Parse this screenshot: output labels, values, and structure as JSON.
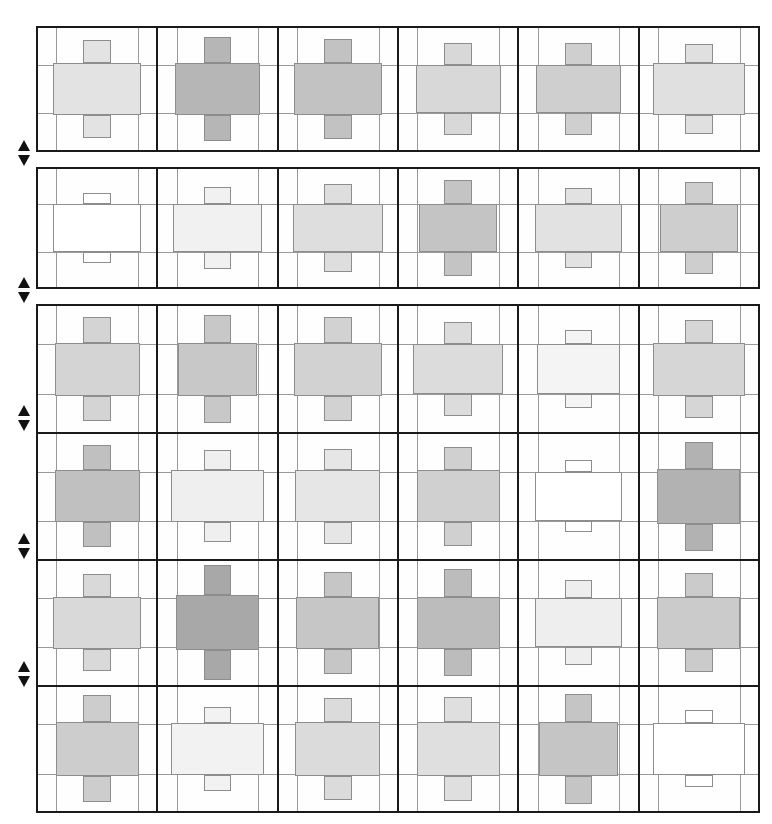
{
  "figure": {
    "type": "cell-grid-matrix",
    "columns": 6,
    "rows": 6,
    "cell_glyph": "cross-bar-plus",
    "colors": {
      "background": "#ffffff",
      "frame": "#1a1a1a",
      "guide_line": "#9a9a9a",
      "fill_outline": "#8d8d8d",
      "empty_fill": "#ffffff"
    },
    "geometry": {
      "grid_left": 36,
      "grid_right": 760,
      "cell_width": 120.7,
      "row_height": 123
    },
    "blocks": [
      {
        "id": "block-1",
        "top": 26,
        "height": 126,
        "row_indices": [
          0
        ]
      },
      {
        "id": "block-2",
        "top": 167,
        "height": 122,
        "row_indices": [
          1
        ]
      },
      {
        "id": "block-3",
        "top": 304,
        "height": 509,
        "row_indices": [
          2,
          3,
          4,
          5
        ]
      }
    ],
    "arrow_markers": [
      {
        "name": "marker-1-up",
        "dir": "up",
        "x": 18,
        "y": 140
      },
      {
        "name": "marker-1-down",
        "dir": "down",
        "x": 18,
        "y": 155
      },
      {
        "name": "marker-2-up",
        "dir": "up",
        "x": 18,
        "y": 277
      },
      {
        "name": "marker-2-down",
        "dir": "down",
        "x": 18,
        "y": 292
      },
      {
        "name": "marker-3-up",
        "dir": "up",
        "x": 18,
        "y": 405
      },
      {
        "name": "marker-3-down",
        "dir": "down",
        "x": 18,
        "y": 420
      },
      {
        "name": "marker-4-up",
        "dir": "up",
        "x": 18,
        "y": 533
      },
      {
        "name": "marker-4-down",
        "dir": "down",
        "x": 18,
        "y": 548
      },
      {
        "name": "marker-5-up",
        "dir": "up",
        "x": 18,
        "y": 661
      },
      {
        "name": "marker-5-down",
        "dir": "down",
        "x": 18,
        "y": 676
      }
    ]
  },
  "chart_data": {
    "type": "heatmap",
    "title": "",
    "xlabel": "",
    "ylabel": "",
    "categories_x": [
      "C1",
      "C2",
      "C3",
      "C4",
      "C5",
      "C6"
    ],
    "categories_y": [
      "R1",
      "R2",
      "R3",
      "R4",
      "R5",
      "R6"
    ],
    "value_scale": "gray intensity 0 (white) to 1 (dark gray #9a9a9a)",
    "legend": [],
    "grid": true,
    "cells": [
      [
        {
          "shade": "#e3e3e3",
          "intensity": 0.22,
          "mid_h": 0.42,
          "mid_w": 0.74,
          "top_h": 0.19,
          "bot_h": 0.19
        },
        {
          "shade": "#b6b6b6",
          "intensity": 0.6,
          "mid_h": 0.42,
          "mid_w": 0.72,
          "top_h": 0.22,
          "bot_h": 0.22
        },
        {
          "shade": "#c2c2c2",
          "intensity": 0.52,
          "mid_h": 0.42,
          "mid_w": 0.74,
          "top_h": 0.2,
          "bot_h": 0.2
        },
        {
          "shade": "#d8d8d8",
          "intensity": 0.3,
          "mid_h": 0.4,
          "mid_w": 0.72,
          "top_h": 0.18,
          "bot_h": 0.18
        },
        {
          "shade": "#cfcfcf",
          "intensity": 0.38,
          "mid_h": 0.4,
          "mid_w": 0.72,
          "top_h": 0.18,
          "bot_h": 0.18
        },
        {
          "shade": "#e0e0e0",
          "intensity": 0.24,
          "mid_h": 0.42,
          "mid_w": 0.78,
          "top_h": 0.16,
          "bot_h": 0.16
        }
      ],
      [
        {
          "shade": "#ffffff",
          "intensity": 0.0,
          "mid_h": 0.4,
          "mid_w": 0.74,
          "top_h": 0.1,
          "bot_h": 0.1
        },
        {
          "shade": "#f1f1f1",
          "intensity": 0.08,
          "mid_h": 0.4,
          "mid_w": 0.76,
          "top_h": 0.15,
          "bot_h": 0.15
        },
        {
          "shade": "#dedede",
          "intensity": 0.26,
          "mid_h": 0.4,
          "mid_w": 0.76,
          "top_h": 0.17,
          "bot_h": 0.17
        },
        {
          "shade": "#c4c4c4",
          "intensity": 0.48,
          "mid_h": 0.4,
          "mid_w": 0.66,
          "top_h": 0.21,
          "bot_h": 0.21
        },
        {
          "shade": "#e2e2e2",
          "intensity": 0.22,
          "mid_h": 0.4,
          "mid_w": 0.74,
          "top_h": 0.14,
          "bot_h": 0.14
        },
        {
          "shade": "#cecece",
          "intensity": 0.38,
          "mid_h": 0.4,
          "mid_w": 0.66,
          "top_h": 0.19,
          "bot_h": 0.19
        }
      ],
      [
        {
          "shade": "#d4d4d4",
          "intensity": 0.32,
          "mid_h": 0.42,
          "mid_w": 0.72,
          "top_h": 0.2,
          "bot_h": 0.2
        },
        {
          "shade": "#c8c8c8",
          "intensity": 0.44,
          "mid_h": 0.42,
          "mid_w": 0.66,
          "top_h": 0.22,
          "bot_h": 0.22
        },
        {
          "shade": "#d2d2d2",
          "intensity": 0.34,
          "mid_h": 0.42,
          "mid_w": 0.74,
          "top_h": 0.2,
          "bot_h": 0.2
        },
        {
          "shade": "#dcdcdc",
          "intensity": 0.27,
          "mid_h": 0.4,
          "mid_w": 0.76,
          "top_h": 0.17,
          "bot_h": 0.17
        },
        {
          "shade": "#f4f4f4",
          "intensity": 0.05,
          "mid_h": 0.4,
          "mid_w": 0.7,
          "top_h": 0.11,
          "bot_h": 0.11
        },
        {
          "shade": "#d6d6d6",
          "intensity": 0.3,
          "mid_h": 0.42,
          "mid_w": 0.78,
          "top_h": 0.18,
          "bot_h": 0.18
        }
      ],
      [
        {
          "shade": "#c0c0c0",
          "intensity": 0.5,
          "mid_h": 0.42,
          "mid_w": 0.72,
          "top_h": 0.2,
          "bot_h": 0.2
        },
        {
          "shade": "#efefef",
          "intensity": 0.1,
          "mid_h": 0.42,
          "mid_w": 0.78,
          "top_h": 0.16,
          "bot_h": 0.16
        },
        {
          "shade": "#e6e6e6",
          "intensity": 0.18,
          "mid_h": 0.42,
          "mid_w": 0.72,
          "top_h": 0.17,
          "bot_h": 0.17
        },
        {
          "shade": "#d0d0d0",
          "intensity": 0.36,
          "mid_h": 0.42,
          "mid_w": 0.7,
          "top_h": 0.19,
          "bot_h": 0.19
        },
        {
          "shade": "#ffffff",
          "intensity": 0.0,
          "mid_h": 0.4,
          "mid_w": 0.74,
          "top_h": 0.09,
          "bot_h": 0.09
        },
        {
          "shade": "#b2b2b2",
          "intensity": 0.64,
          "mid_h": 0.44,
          "mid_w": 0.7,
          "top_h": 0.22,
          "bot_h": 0.22
        }
      ],
      [
        {
          "shade": "#d9d9d9",
          "intensity": 0.28,
          "mid_h": 0.42,
          "mid_w": 0.74,
          "top_h": 0.18,
          "bot_h": 0.18
        },
        {
          "shade": "#a8a8a8",
          "intensity": 0.72,
          "mid_h": 0.44,
          "mid_w": 0.7,
          "top_h": 0.24,
          "bot_h": 0.24
        },
        {
          "shade": "#c6c6c6",
          "intensity": 0.46,
          "mid_h": 0.42,
          "mid_w": 0.7,
          "top_h": 0.2,
          "bot_h": 0.2
        },
        {
          "shade": "#bcbcbc",
          "intensity": 0.56,
          "mid_h": 0.42,
          "mid_w": 0.7,
          "top_h": 0.22,
          "bot_h": 0.22
        },
        {
          "shade": "#eeeeee",
          "intensity": 0.12,
          "mid_h": 0.4,
          "mid_w": 0.74,
          "top_h": 0.14,
          "bot_h": 0.14
        },
        {
          "shade": "#cbcbcb",
          "intensity": 0.42,
          "mid_h": 0.42,
          "mid_w": 0.7,
          "top_h": 0.19,
          "bot_h": 0.19
        }
      ],
      [
        {
          "shade": "#cdcdcd",
          "intensity": 0.4,
          "mid_h": 0.44,
          "mid_w": 0.7,
          "top_h": 0.21,
          "bot_h": 0.21
        },
        {
          "shade": "#f2f2f2",
          "intensity": 0.07,
          "mid_h": 0.42,
          "mid_w": 0.78,
          "top_h": 0.13,
          "bot_h": 0.13
        },
        {
          "shade": "#dbdbdb",
          "intensity": 0.26,
          "mid_h": 0.44,
          "mid_w": 0.72,
          "top_h": 0.19,
          "bot_h": 0.19
        },
        {
          "shade": "#dfdfdf",
          "intensity": 0.24,
          "mid_h": 0.44,
          "mid_w": 0.7,
          "top_h": 0.2,
          "bot_h": 0.2
        },
        {
          "shade": "#c5c5c5",
          "intensity": 0.47,
          "mid_h": 0.44,
          "mid_w": 0.66,
          "top_h": 0.22,
          "bot_h": 0.22
        },
        {
          "shade": "#ffffff",
          "intensity": 0.0,
          "mid_h": 0.42,
          "mid_w": 0.78,
          "top_h": 0.1,
          "bot_h": 0.1
        }
      ]
    ]
  }
}
